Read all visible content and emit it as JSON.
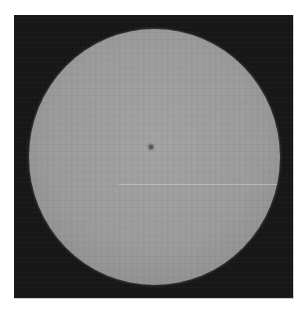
{
  "image": {
    "subject": "Full solar disk (white-light photograph)",
    "colors": {
      "page_background": "#ffffff",
      "sky_background": "#161616",
      "disk_center": "#a3a3a3",
      "disk_limb": "#7a7a7a",
      "sunspot": "#555555"
    },
    "features": [
      {
        "name": "sunspot",
        "description": "single small dark sunspot, upper-left of disk center"
      },
      {
        "name": "scan-line",
        "description": "faint horizontal bright line across lower-middle of disk"
      }
    ]
  }
}
